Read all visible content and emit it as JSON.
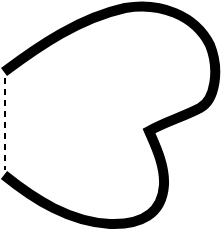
{
  "figure": {
    "stroke_color": "#000000",
    "background_color": "#ffffff",
    "outline_stroke_width": 10,
    "dash_stroke_width": 2
  }
}
